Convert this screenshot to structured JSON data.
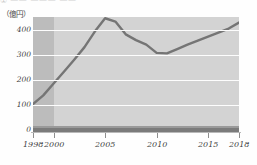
{
  "heading": {
    "circled_number": "①",
    "text": "—— ——— ——",
    "clipped": true
  },
  "chart_data": {
    "type": "line",
    "title": "",
    "subtitle": "",
    "xlabel": "",
    "ylabel": "",
    "unit_label": "（億円）",
    "grid": true,
    "legend": "none",
    "xlim": [
      1998,
      2018
    ],
    "ylim": [
      0,
      450
    ],
    "yticks": [
      0,
      100,
      200,
      300,
      400
    ],
    "ytick_labels": [
      "0",
      "100",
      "200",
      "300",
      "400"
    ],
    "xticks": [
      1998,
      2000,
      2005,
      2010,
      2015,
      2018
    ],
    "xtick_labels": [
      "1998",
      "2000",
      "2005",
      "2010",
      "2015",
      "2018"
    ],
    "highlight_band": {
      "from": 1998,
      "to": 2000
    },
    "series": [
      {
        "name": "金額",
        "color": "#757575",
        "x": [
          1998,
          1999,
          2000,
          2001,
          2002,
          2003,
          2004,
          2005,
          2006,
          2007,
          2008,
          2009,
          2010,
          2011,
          2012,
          2013,
          2014,
          2015,
          2016,
          2017,
          2018
        ],
        "values": [
          103,
          138,
          185,
          232,
          280,
          330,
          392,
          445,
          432,
          381,
          358,
          340,
          307,
          305,
          322,
          340,
          356,
          372,
          388,
          404,
          428
        ]
      }
    ],
    "annotations": {
      "peak_year": 2005,
      "peak_value": 445,
      "trough_year": 2010,
      "trough_value": 305,
      "start_value": 103,
      "end_value": 428
    },
    "colors": {
      "plot_background": "#d3d3d3",
      "band_background": "#bcbcbc",
      "gridline": "#fdfdfd",
      "line": "#757575",
      "baseline_bar": "#7b7b7b",
      "axis_text": "#3f3f3f"
    }
  }
}
